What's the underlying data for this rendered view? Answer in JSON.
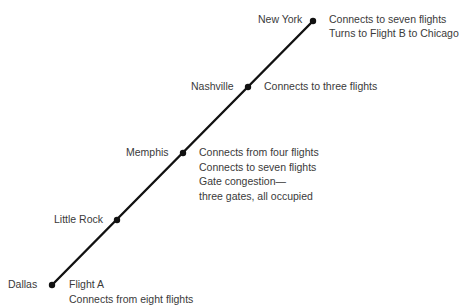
{
  "diagram": {
    "type": "flight-route",
    "line_color": "#111111",
    "text_color": "#3a3a3a",
    "stops": [
      {
        "name": "Dallas",
        "notes": [
          "Flight A",
          "Connects from eight flights"
        ]
      },
      {
        "name": "Little Rock",
        "notes": []
      },
      {
        "name": "Memphis",
        "notes": [
          "Connects from four flights",
          "Connects to seven flights",
          "Gate congestion—",
          "three gates, all occupied"
        ]
      },
      {
        "name": "Nashville",
        "notes": [
          "Connects to three flights"
        ]
      },
      {
        "name": "New York",
        "notes": [
          "Connects to seven flights",
          "Turns to Flight B to Chicago"
        ]
      }
    ]
  }
}
